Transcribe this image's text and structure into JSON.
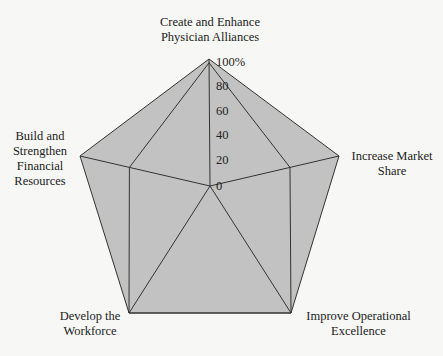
{
  "chart_data": {
    "type": "radar",
    "title": "",
    "axes": [
      "Create and Enhance Physician Alliances",
      "Increase Market Share",
      "Improve Operational Excellence",
      "Develop the Workforce",
      "Build and Strengthen Financial Resources"
    ],
    "axis_labels_display": [
      "Create and Enhance\nPhysician Alliances",
      "Increase Market\nShare",
      "Improve Operational\nExcellence",
      "Develop the\nWorkforce",
      "Build and\nStrengthen\nFinancial\nResources"
    ],
    "radial_ticks": [
      "0",
      "20",
      "40",
      "60",
      "80",
      "100%"
    ],
    "rlim": [
      0,
      100
    ],
    "series": [
      {
        "name": "Outer",
        "values": [
          100,
          100,
          100,
          100,
          100
        ]
      },
      {
        "name": "Inner",
        "values": [
          97,
          62,
          100,
          100,
          62
        ]
      }
    ],
    "colors": {
      "fill": "#c2c2c2",
      "line": "#333333"
    },
    "grid": false,
    "legend": "none"
  }
}
